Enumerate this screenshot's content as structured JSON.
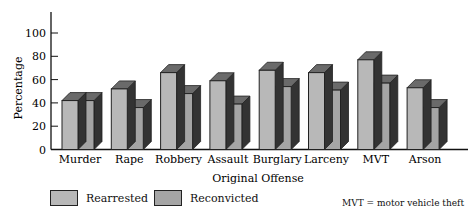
{
  "chart_data": {
    "type": "bar",
    "title": "",
    "xlabel": "Original Offense",
    "ylabel": "Percentage",
    "ylim": [
      0,
      110
    ],
    "yticks": [
      0,
      20,
      40,
      60,
      80,
      100
    ],
    "grid": false,
    "legend_position": "bottom",
    "categories": [
      "Murder",
      "Rape",
      "Robbery",
      "Assault",
      "Burglary",
      "Larceny",
      "MVT",
      "Arson"
    ],
    "series": [
      {
        "name": "Rearrested",
        "color": "#b8b8b8",
        "values": [
          42,
          52,
          66,
          59,
          68,
          66,
          77,
          53
        ]
      },
      {
        "name": "Reconvicted",
        "color": "#a5a5a5",
        "values": [
          42,
          36,
          48,
          39,
          54,
          51,
          57,
          36
        ]
      }
    ],
    "annotations": [
      "MVT = motor vehicle theft"
    ]
  },
  "legend": {
    "rearrested_label": "Rearrested",
    "reconvicted_label": "Reconvicted"
  },
  "note": "MVT = motor vehicle theft",
  "colors": {
    "top": "#6a6a6a",
    "side": "#333333",
    "outline": "#222222"
  }
}
